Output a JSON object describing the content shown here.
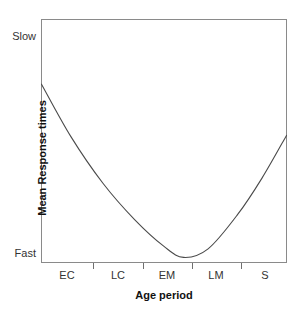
{
  "chart_data": {
    "type": "line",
    "title": "",
    "subtitle": "",
    "xlabel": "Age period",
    "ylabel": "Mean Response times",
    "categories": [
      "EC",
      "LC",
      "EM",
      "LM",
      "S"
    ],
    "x": [
      "EC",
      "LC",
      "EM",
      "LM",
      "S"
    ],
    "series": [
      {
        "name": "Mean response time",
        "values": [
          0.74,
          0.22,
          0.03,
          0.18,
          0.53
        ]
      }
    ],
    "y_tick_labels": [
      "Fast",
      "Slow"
    ],
    "y_axis_direction": "Fast at bottom, Slow at top",
    "ylim": [
      0,
      1
    ],
    "ylim_labels": [
      "Fast",
      "Slow"
    ],
    "grid": false,
    "legend": false,
    "legend_position": "none",
    "annotations": [],
    "curve_description": "U-shaped (quadratic) curve: response times start slow in early childhood, reach fastest at early maturity (EM), then slow again toward senescence (S)",
    "curve_points": [
      {
        "x": 0.0,
        "y": 0.735
      },
      {
        "x": 0.12,
        "y": 0.52
      },
      {
        "x": 0.25,
        "y": 0.33
      },
      {
        "x": 0.38,
        "y": 0.18
      },
      {
        "x": 0.5,
        "y": 0.07
      },
      {
        "x": 0.58,
        "y": 0.025
      },
      {
        "x": 0.68,
        "y": 0.06
      },
      {
        "x": 0.8,
        "y": 0.2
      },
      {
        "x": 0.9,
        "y": 0.35
      },
      {
        "x": 1.0,
        "y": 0.525
      }
    ],
    "line_color": "#4a4a4a",
    "frame_color": "#8a8a8a",
    "background_color": "#ffffff"
  },
  "axes": {
    "y": {
      "title": "Mean Response times",
      "top_label": "Slow",
      "bottom_label": "Fast"
    },
    "x": {
      "title": "Age period",
      "ticks": [
        {
          "label": "EC"
        },
        {
          "label": "LC"
        },
        {
          "label": "EM"
        },
        {
          "label": "LM"
        },
        {
          "label": "S"
        }
      ]
    }
  }
}
